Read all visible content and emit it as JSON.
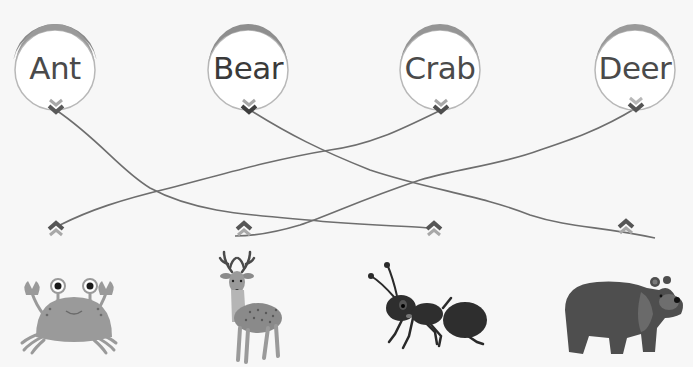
{
  "game": {
    "type": "matching",
    "instruction_visible": false
  },
  "words": [
    {
      "label": "Ant",
      "x": 7,
      "y": 18
    },
    {
      "label": "Bear",
      "x": 200,
      "y": 18
    },
    {
      "label": "Crab",
      "x": 392,
      "y": 18
    },
    {
      "label": "Deer",
      "x": 587,
      "y": 18
    }
  ],
  "animals": [
    {
      "name": "crab",
      "anchor_x": 55,
      "anchor_y": 228
    },
    {
      "name": "deer",
      "anchor_x": 243,
      "anchor_y": 228
    },
    {
      "name": "ant",
      "anchor_x": 433,
      "anchor_y": 228
    },
    {
      "name": "bear",
      "anchor_x": 625,
      "anchor_y": 226
    }
  ],
  "connections": [
    {
      "from": "Ant",
      "to": "ant"
    },
    {
      "from": "Bear",
      "to": "bear"
    },
    {
      "from": "Crab",
      "to": "crab"
    },
    {
      "from": "Deer",
      "to": "deer"
    }
  ],
  "colors": {
    "ring": "#8a8a8a",
    "ring_inner": "#b8b8b8",
    "line": "#6e6e6e",
    "chevron_dark": "#5a5a5a",
    "chevron_light": "#a8a8a8",
    "text": "#4a4a4a"
  }
}
